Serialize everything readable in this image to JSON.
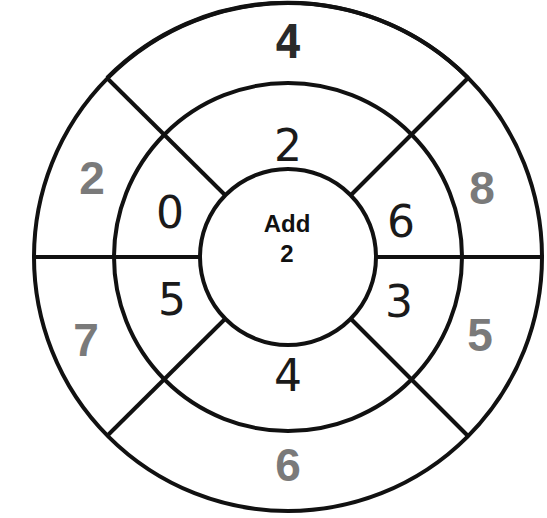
{
  "wheel": {
    "center": {
      "operation": "Add",
      "operand": "2"
    },
    "inner_ring": {
      "top": "2",
      "upper_right": "6",
      "lower_right": "3",
      "bottom": "4",
      "lower_left": "5",
      "upper_left": "0"
    },
    "outer_ring": {
      "top": "4",
      "upper_right": "8",
      "lower_right": "5",
      "bottom": "6",
      "lower_left": "7",
      "upper_left": "2"
    },
    "colors": {
      "line": "#111111",
      "inner_text": "#1a1a1a",
      "outer_text": "#7a7a7a",
      "outer_top_text": "#2a2a2a"
    }
  }
}
